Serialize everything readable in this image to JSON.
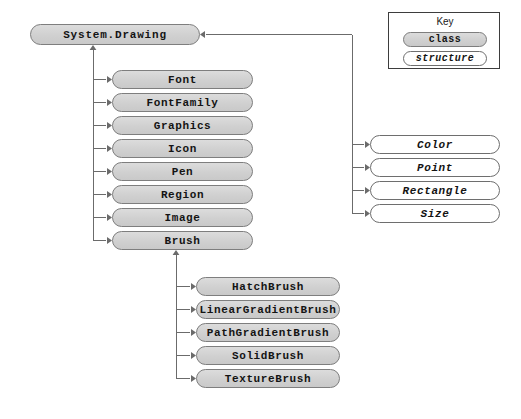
{
  "diagram": {
    "root": {
      "label": "System.Drawing",
      "kind": "class",
      "x": 30,
      "y": 24,
      "w": 170,
      "h": 21
    },
    "key": {
      "title": "Key",
      "class_label": "class",
      "structure_label": "structure"
    },
    "colors": {
      "background": "#ffffff",
      "class_fill": "#d2d2d2",
      "class_border": "#7e7e7e",
      "structure_fill": "#ffffff",
      "structure_border": "#6e6e6e",
      "connector": "#6b6b6b",
      "key_border": "#3d3d3d",
      "text": "#141414"
    },
    "groups": [
      {
        "name": "classes",
        "kind": "class",
        "trunk_x": 93,
        "box_x": 112,
        "box_w": 141,
        "box_h": 19,
        "nodes": [
          {
            "label": "Font",
            "y": 70
          },
          {
            "label": "FontFamily",
            "y": 93
          },
          {
            "label": "Graphics",
            "y": 116
          },
          {
            "label": "Icon",
            "y": 139
          },
          {
            "label": "Pen",
            "y": 162
          },
          {
            "label": "Region",
            "y": 185
          },
          {
            "label": "Image",
            "y": 208
          },
          {
            "label": "Brush",
            "y": 231
          }
        ]
      },
      {
        "name": "structures",
        "kind": "structure",
        "trunk_x": 352,
        "box_x": 370,
        "box_w": 130,
        "box_h": 19,
        "nodes": [
          {
            "label": "Color",
            "y": 135
          },
          {
            "label": "Point",
            "y": 158
          },
          {
            "label": "Rectangle",
            "y": 181
          },
          {
            "label": "Size",
            "y": 204
          }
        ]
      },
      {
        "name": "brushes",
        "kind": "class",
        "trunk_x": 176,
        "box_x": 196,
        "box_w": 144,
        "box_h": 19,
        "nodes": [
          {
            "label": "HatchBrush",
            "y": 277
          },
          {
            "label": "LinearGradientBrush",
            "y": 300
          },
          {
            "label": "PathGradientBrush",
            "y": 323
          },
          {
            "label": "SolidBrush",
            "y": 346
          },
          {
            "label": "TextureBrush",
            "y": 369
          }
        ]
      }
    ]
  }
}
